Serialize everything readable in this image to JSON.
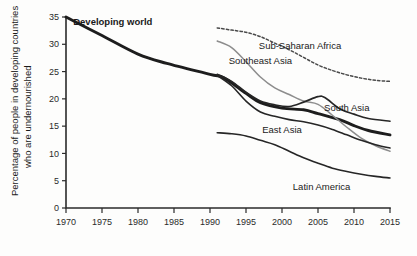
{
  "chart_data": {
    "type": "line",
    "title": "",
    "xlabel": "",
    "ylabel": "Percentage of people in developing countries who are undernourished",
    "xlim": [
      1970,
      2015
    ],
    "ylim": [
      0,
      35
    ],
    "grid": false,
    "legend": "inline-labels",
    "xticks": [
      "1970",
      "1975",
      "1980",
      "1985",
      "1990",
      "1995",
      "2000",
      "2005",
      "2010",
      "2015"
    ],
    "yticks": [
      "0",
      "5",
      "10",
      "15",
      "20",
      "25",
      "30",
      "35"
    ],
    "series": [
      {
        "name": "Developing world",
        "style": "solid-thick-black",
        "color": "#1d1d1d",
        "width": 2.9,
        "label_x": 1976.5,
        "label_y": 34.2,
        "bold": true,
        "x": [
          1970,
          1975,
          1980,
          1984,
          1990,
          1992,
          1995,
          1997,
          2000,
          2003,
          2005,
          2008,
          2010,
          2012,
          2015
        ],
        "y": [
          35.0,
          31.6,
          28.2,
          26.5,
          24.5,
          23.8,
          21.0,
          19.3,
          18.3,
          18.0,
          17.3,
          16.2,
          15.1,
          14.2,
          13.4
        ]
      },
      {
        "name": "Sub-Saharan Africa",
        "style": "dashed-gray",
        "color": "#4a4a4a",
        "width": 1.5,
        "dash": "2.4 2.2",
        "label_x": 2002.5,
        "label_y": 29.8,
        "bold": false,
        "x": [
          1991,
          1993,
          1995,
          1997,
          1999,
          2001,
          2003,
          2005,
          2007,
          2009,
          2011,
          2013,
          2015
        ],
        "y": [
          33.0,
          32.6,
          32.2,
          31.4,
          30.2,
          29.0,
          27.6,
          26.2,
          25.2,
          24.4,
          23.8,
          23.4,
          23.2
        ]
      },
      {
        "name": "Southeast Asia",
        "style": "solid-light-gray",
        "color": "#8d8d8d",
        "width": 1.5,
        "label_x": 1997.0,
        "label_y": 27.0,
        "bold": false,
        "x": [
          1991,
          1993,
          1995,
          1997,
          1999,
          2001,
          2003,
          2005,
          2007,
          2009,
          2011,
          2013,
          2015
        ],
        "y": [
          30.6,
          29.4,
          26.8,
          24.0,
          22.0,
          20.8,
          19.6,
          19.0,
          17.0,
          14.8,
          12.8,
          11.4,
          10.4
        ]
      },
      {
        "name": "South Asia",
        "style": "solid-thin-black",
        "color": "#262626",
        "width": 1.7,
        "label_x": 2009.0,
        "label_y": 18.4,
        "bold": false,
        "x": [
          1991,
          1993,
          1995,
          1997,
          1999,
          2001,
          2003,
          2005,
          2006,
          2008,
          2010,
          2012,
          2015
        ],
        "y": [
          24.5,
          23.2,
          21.2,
          19.6,
          18.9,
          18.6,
          19.4,
          20.4,
          20.2,
          18.2,
          17.2,
          16.4,
          15.9
        ]
      },
      {
        "name": "East Asia",
        "style": "solid-thin-black",
        "color": "#262626",
        "width": 1.6,
        "label_x": 2000.0,
        "label_y": 14.4,
        "bold": false,
        "x": [
          1991,
          1993,
          1995,
          1997,
          1999,
          2001,
          2003,
          2005,
          2007,
          2009,
          2011,
          2013,
          2015
        ],
        "y": [
          24.3,
          22.4,
          19.6,
          17.6,
          16.8,
          16.2,
          15.8,
          15.2,
          14.4,
          13.4,
          12.4,
          11.6,
          11.0
        ]
      },
      {
        "name": "Latin America",
        "style": "solid-thin-black",
        "color": "#262626",
        "width": 1.6,
        "label_x": 2005.5,
        "label_y": 4.0,
        "bold": false,
        "x": [
          1991,
          1993,
          1995,
          1997,
          1999,
          2001,
          2003,
          2005,
          2007,
          2009,
          2011,
          2013,
          2015
        ],
        "y": [
          13.8,
          13.6,
          13.2,
          12.4,
          11.6,
          10.4,
          9.2,
          8.2,
          7.3,
          6.7,
          6.2,
          5.8,
          5.5
        ]
      }
    ]
  }
}
